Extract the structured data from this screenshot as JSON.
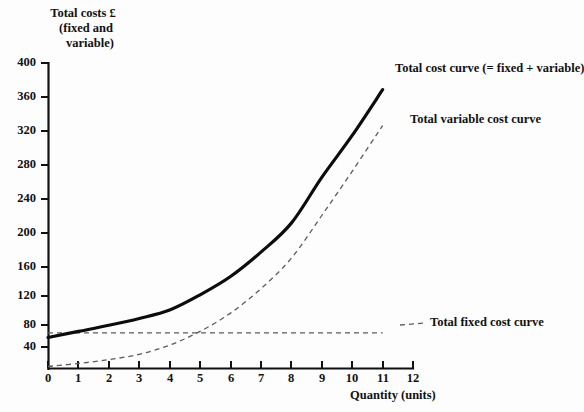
{
  "chart_data": {
    "type": "line",
    "title": "",
    "ylabel": "Total costs £ (fixed and variable)",
    "ylabel_lines": [
      "Total costs £",
      "(fixed and",
      "variable)"
    ],
    "xlabel": "Quantity (units)",
    "xlim": [
      0,
      12
    ],
    "ylim": [
      0,
      400
    ],
    "xticks": [
      "0",
      "1",
      "2",
      "3",
      "4",
      "5",
      "6",
      "7",
      "8",
      "9",
      "10",
      "11",
      "12"
    ],
    "yticks": [
      "40",
      "80",
      "120",
      "160",
      "200",
      "240",
      "280",
      "320",
      "360",
      "400"
    ],
    "grid": false,
    "legend_position": "inline-annotations",
    "x": [
      0,
      1,
      2,
      3,
      4,
      5,
      6,
      7,
      8,
      9,
      10,
      11
    ],
    "series": [
      {
        "name": "Total cost curve (= fixed + variable)",
        "style": "solid",
        "color": "#0c0c0c",
        "values": [
          40,
          48,
          56,
          65,
          76,
          96,
          120,
          152,
          190,
          250,
          305,
          365
        ]
      },
      {
        "name": "Total variable cost curve",
        "style": "dashed",
        "color": "#5c5c5c",
        "values": [
          2,
          6,
          11,
          18,
          30,
          48,
          72,
          104,
          144,
          200,
          258,
          318
        ]
      },
      {
        "name": "Total fixed cost curve",
        "style": "dashed",
        "color": "#5c5c5c",
        "values": [
          46,
          46,
          46,
          46,
          46,
          46,
          46,
          46,
          46,
          46,
          46,
          46
        ]
      }
    ],
    "annotations": [
      {
        "text": "Total cost curve (= fixed + variable)",
        "target_series": "Total cost curve (= fixed + variable)"
      },
      {
        "text": "Total variable cost curve",
        "target_series": "Total variable cost curve"
      },
      {
        "text": "Total fixed cost curve",
        "target_series": "Total fixed cost curve"
      }
    ]
  },
  "axis": {
    "y_title_line1": "Total costs £",
    "y_title_line2": "(fixed and",
    "y_title_line3": "variable)",
    "x_title": "Quantity (units)",
    "yticks": {
      "t400": "400",
      "t360": "360",
      "t320": "320",
      "t280": "280",
      "t240": "240",
      "t200": "200",
      "t160": "160",
      "t120": "120",
      "t80": "80",
      "t40": "40"
    },
    "xticks": {
      "t0": "0",
      "t1": "1",
      "t2": "2",
      "t3": "3",
      "t4": "4",
      "t5": "5",
      "t6": "6",
      "t7": "7",
      "t8": "8",
      "t9": "9",
      "t10": "10",
      "t11": "11",
      "t12": "12"
    }
  },
  "labels": {
    "total_cost": "Total cost curve (= fixed + variable)",
    "variable_cost": "Total variable cost curve",
    "fixed_cost": "Total fixed cost curve"
  },
  "colors": {
    "total_cost": "#0c0c0c",
    "variable_cost": "#5c5c5c",
    "fixed_cost": "#5c5c5c",
    "axis": "#111111",
    "background": "#fdfdfd"
  }
}
